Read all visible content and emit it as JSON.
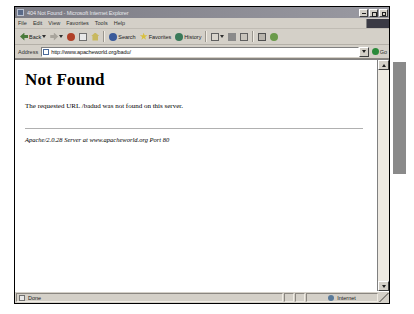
{
  "window": {
    "title": "404 Not Found - Microsoft Internet Explorer",
    "icon": "ie-document-icon",
    "controls": {
      "minimize": "Minimize",
      "maximize": "Maximize",
      "close": "Close"
    }
  },
  "menu": {
    "items": [
      {
        "label": "File"
      },
      {
        "label": "Edit"
      },
      {
        "label": "View"
      },
      {
        "label": "Favorites"
      },
      {
        "label": "Tools"
      },
      {
        "label": "Help"
      }
    ]
  },
  "toolbar": {
    "buttons": [
      {
        "label": "Back",
        "icon": "back-arrow-icon",
        "has_dropdown": true
      },
      {
        "label": "",
        "icon": "forward-arrow-icon",
        "has_dropdown": true
      },
      {
        "label": "",
        "icon": "stop-icon",
        "has_dropdown": false
      },
      {
        "label": "",
        "icon": "refresh-icon",
        "has_dropdown": false
      },
      {
        "label": "",
        "icon": "home-icon",
        "has_dropdown": false
      },
      {
        "label": "Search",
        "icon": "search-icon",
        "has_dropdown": false
      },
      {
        "label": "Favorites",
        "icon": "favorites-star-icon",
        "has_dropdown": false
      },
      {
        "label": "History",
        "icon": "history-clock-icon",
        "has_dropdown": false
      },
      {
        "label": "",
        "icon": "mail-icon",
        "has_dropdown": true
      },
      {
        "label": "",
        "icon": "print-icon",
        "has_dropdown": false
      },
      {
        "label": "",
        "icon": "edit-icon",
        "has_dropdown": false
      },
      {
        "label": "",
        "icon": "discuss-icon",
        "has_dropdown": false
      },
      {
        "label": "",
        "icon": "messenger-icon",
        "has_dropdown": false
      }
    ]
  },
  "address": {
    "label": "Address",
    "url": "http://www.apacheworld.org/badu/",
    "placeholder": "",
    "go_label": "Go"
  },
  "page": {
    "heading": "Not Found",
    "message": "The requested URL /badud was not found on this server.",
    "signature": "Apache/2.0.28 Server at www.apacheworld.org Port 80"
  },
  "status": {
    "text": "Done",
    "zone": "Internet"
  }
}
